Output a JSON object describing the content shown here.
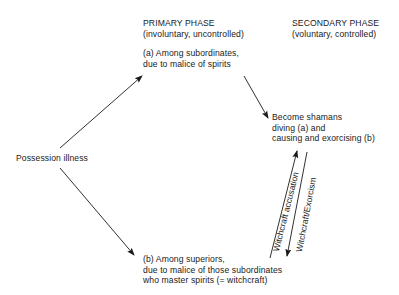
{
  "diagram": {
    "primary_phase": {
      "title": "PRIMARY PHASE",
      "subtitle": "(involuntary, uncontrolled)"
    },
    "secondary_phase": {
      "title": "SECONDARY PHASE",
      "subtitle": "(voluntary, controlled)"
    },
    "nodes": {
      "possession": {
        "label": "Possession illness"
      },
      "subordinates": {
        "lines": [
          "(a) Among subordinates,",
          "due to malice of spirits"
        ]
      },
      "shamans": {
        "lines": [
          "Become shamans",
          "diving (a) and",
          "causing and exorcising (b)"
        ]
      },
      "superiors": {
        "lines": [
          "(b) Among superiors,",
          "due to malice of those subordinates",
          "who master spirits (= witchcraft)"
        ]
      }
    },
    "edges": {
      "witchcraft_accusation": "Witchcraft accusation",
      "witchcraft_exorcism": "Witchcraft/Exorcism"
    },
    "colors": {
      "ink": "#1a1a1a",
      "background": "#ffffff"
    }
  }
}
